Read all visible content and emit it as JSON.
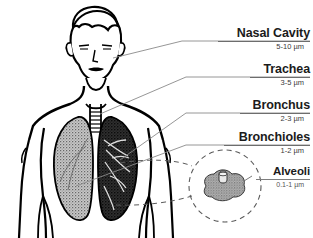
{
  "diagram": {
    "style": "black-and-white line art with grayscale stippled lungs",
    "labels": [
      {
        "name": "Nasal Cavity",
        "size": "5-10 µm",
        "leader": "solid"
      },
      {
        "name": "Trachea",
        "size": "3-5 µm",
        "leader": "solid"
      },
      {
        "name": "Bronchus",
        "size": "2-3 µm",
        "leader": "solid"
      },
      {
        "name": "Bronchioles",
        "size": "1-2 µm",
        "leader": "solid"
      },
      {
        "name": "Alveoli",
        "size": "0.1-1 µm",
        "leader": "dashed"
      }
    ],
    "colors": {
      "background": "#ffffff",
      "outline": "#000000",
      "label_text": "#1b1b1b",
      "size_text": "#3b3b3b",
      "rule": "#6d6d6d",
      "leader_line": "#8a8a8a",
      "left_lung": "#8d8d8d",
      "right_lung": "#2b2b2b"
    }
  }
}
